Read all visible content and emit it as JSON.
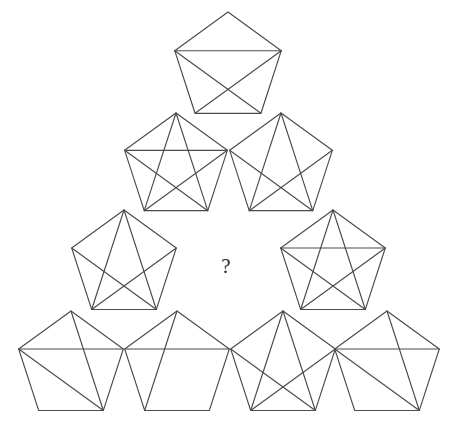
{
  "figure": {
    "background_color": "#ffffff",
    "stroke_color": "#4a4a52",
    "stroke_width": 1.15,
    "width": 452,
    "height": 436
  },
  "question_cell": {
    "label": "?",
    "x": 226,
    "y": 268,
    "font_size": 21,
    "color": "#2e2e33"
  },
  "vertex_scheme": {
    "note": "Pentagon vertices indexed clockwise from the top apex.",
    "names": [
      "apex",
      "right",
      "bottom-right",
      "bottom-left",
      "left"
    ],
    "angles_deg": [
      -90,
      -18,
      54,
      126,
      198
    ]
  },
  "diagonal_names": {
    "0-2": "apex-to-bottom-right",
    "0-3": "apex-to-bottom-left",
    "1-3": "right-to-bottom-left",
    "1-4": "right-to-left-horizontal",
    "2-4": "bottom-right-to-left"
  },
  "pentagons": [
    {
      "id": "pentagon-row1-1",
      "row": 1,
      "position": 1,
      "cx": 228,
      "cy": 68,
      "radius": 56,
      "diagonal_count": 3,
      "diagonals": [
        "1-4",
        "2-4",
        "1-3"
      ]
    },
    {
      "id": "pentagon-row2-1",
      "row": 2,
      "position": 1,
      "cx": 176,
      "cy": 167,
      "radius": 54,
      "diagonal_count": 5,
      "diagonals": [
        "0-3",
        "0-2",
        "1-4",
        "2-4",
        "1-3"
      ]
    },
    {
      "id": "pentagon-row2-2",
      "row": 2,
      "position": 2,
      "cx": 281,
      "cy": 167,
      "radius": 54,
      "diagonal_count": 4,
      "diagonals": [
        "0-3",
        "0-2",
        "2-4",
        "1-3"
      ]
    },
    {
      "id": "pentagon-row3-1",
      "row": 3,
      "position": 1,
      "cx": 124,
      "cy": 265,
      "radius": 55,
      "diagonal_count": 4,
      "diagonals": [
        "0-3",
        "0-2",
        "2-4",
        "1-3"
      ]
    },
    {
      "id": "pentagon-row3-2",
      "row": 3,
      "position": 2,
      "cx": 333,
      "cy": 265,
      "radius": 55,
      "diagonal_count": 5,
      "diagonals": [
        "0-3",
        "0-2",
        "1-4",
        "2-4",
        "1-3"
      ]
    },
    {
      "id": "pentagon-row4-1",
      "row": 4,
      "position": 1,
      "cx": 71,
      "cy": 366,
      "radius": 55,
      "diagonal_count": 3,
      "diagonals": [
        "1-4",
        "0-2",
        "2-4"
      ]
    },
    {
      "id": "pentagon-row4-2",
      "row": 4,
      "position": 2,
      "cx": 177,
      "cy": 366,
      "radius": 55,
      "diagonal_count": 2,
      "diagonals": [
        "1-4",
        "0-3"
      ]
    },
    {
      "id": "pentagon-row4-3",
      "row": 4,
      "position": 3,
      "cx": 283,
      "cy": 366,
      "radius": 55,
      "diagonal_count": 4,
      "diagonals": [
        "0-3",
        "0-2",
        "2-4",
        "1-3"
      ]
    },
    {
      "id": "pentagon-row4-4",
      "row": 4,
      "position": 4,
      "cx": 387,
      "cy": 366,
      "radius": 55,
      "diagonal_count": 3,
      "diagonals": [
        "1-4",
        "0-2",
        "2-4"
      ]
    }
  ]
}
